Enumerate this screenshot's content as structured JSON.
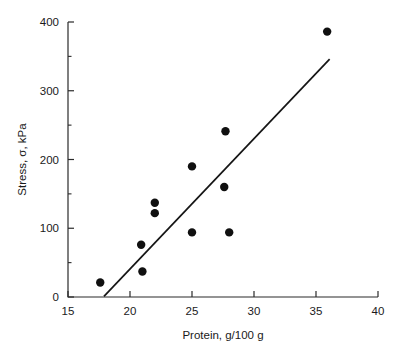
{
  "chart_data": {
    "type": "scatter",
    "title": "",
    "xlabel": "Protein, g/100 g",
    "ylabel": "Stress, σ, kPa",
    "xlim": [
      15,
      40
    ],
    "ylim": [
      0,
      400
    ],
    "grid": false,
    "legend": null,
    "x_ticks": [
      15,
      20,
      25,
      30,
      35,
      40
    ],
    "x_tick_labels": [
      "15",
      "20",
      "25",
      "30",
      "35",
      "40"
    ],
    "x_minor_ticks": [],
    "y_ticks": [
      0,
      100,
      200,
      300,
      400
    ],
    "y_tick_labels": [
      "0",
      "100",
      "200",
      "300",
      "400"
    ],
    "y_minor_ticks": [
      50,
      150,
      250,
      350
    ],
    "points": [
      {
        "x": 17.6,
        "y": 21
      },
      {
        "x": 20.9,
        "y": 76
      },
      {
        "x": 21.0,
        "y": 37
      },
      {
        "x": 22.0,
        "y": 137
      },
      {
        "x": 22.0,
        "y": 122
      },
      {
        "x": 25.0,
        "y": 190
      },
      {
        "x": 25.0,
        "y": 94
      },
      {
        "x": 27.7,
        "y": 241
      },
      {
        "x": 27.6,
        "y": 160
      },
      {
        "x": 28.0,
        "y": 94
      },
      {
        "x": 35.9,
        "y": 386
      }
    ],
    "fit_line": {
      "x": [
        17.9,
        36.1
      ],
      "y": [
        1,
        346
      ]
    },
    "marker": {
      "shape": "circle",
      "size_px": 4.2,
      "color": "#101010"
    },
    "line_color": "#151515",
    "axis_color": "#2b2b2b",
    "background": "#ffffff"
  }
}
